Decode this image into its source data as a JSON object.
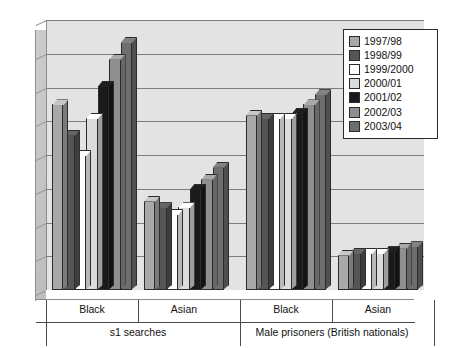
{
  "chart_data": {
    "type": "bar",
    "title": "",
    "subtitle": "",
    "xlabel": "",
    "ylabel": "",
    "ylim": [
      0.0,
      16.0
    ],
    "ytick_step": 2.0,
    "ytick_labels": [
      "0.0",
      "2.0",
      "4.0",
      "6.0",
      "8.0",
      "10.0",
      "12.0",
      "14.0",
      "16.0"
    ],
    "grid": true,
    "legend_position": "top-right",
    "style": "3d-grouped-column",
    "categories": [
      "Black",
      "Asian",
      "Black",
      "Asian"
    ],
    "supergroups": [
      {
        "label": "s1 searches",
        "categories": [
          "Black",
          "Asian"
        ]
      },
      {
        "label": "Male prisoners (British nationals)",
        "categories": [
          "Black",
          "Asian"
        ]
      }
    ],
    "series": [
      {
        "name": "1997/98",
        "color": "#a9a9a9",
        "values": [
          11.0,
          5.3,
          10.4,
          2.1
        ]
      },
      {
        "name": "1998/99",
        "color": "#555555",
        "values": [
          9.2,
          4.9,
          10.2,
          2.2
        ]
      },
      {
        "name": "1999/2000",
        "color": "#ffffff",
        "values": [
          8.0,
          4.5,
          10.2,
          2.2
        ]
      },
      {
        "name": "2000/01",
        "color": "#dcdcdc",
        "values": [
          10.2,
          4.9,
          10.2,
          2.2
        ]
      },
      {
        "name": "2001/02",
        "color": "#1a1a1a",
        "values": [
          12.1,
          6.0,
          10.5,
          2.3
        ]
      },
      {
        "name": "2002/03",
        "color": "#8f8f8f",
        "values": [
          13.7,
          6.6,
          11.0,
          2.5
        ]
      },
      {
        "name": "2003/04",
        "color": "#6e6e6e",
        "values": [
          14.7,
          7.3,
          11.6,
          2.6
        ]
      }
    ]
  },
  "legend": {
    "items": [
      {
        "label": "1997/98",
        "color": "#a9a9a9"
      },
      {
        "label": "1998/99",
        "color": "#555555"
      },
      {
        "label": "1999/2000",
        "color": "#ffffff"
      },
      {
        "label": "2000/01",
        "color": "#dcdcdc"
      },
      {
        "label": "2001/02",
        "color": "#1a1a1a"
      },
      {
        "label": "2002/03",
        "color": "#8f8f8f"
      },
      {
        "label": "2003/04",
        "color": "#6e6e6e"
      }
    ]
  },
  "axes": {
    "y_ticks": [
      "16.0",
      "14.0",
      "12.0",
      "10.0",
      "8.0",
      "6.0",
      "4.0",
      "2.0",
      "0.0"
    ],
    "category_labels": [
      "Black",
      "Asian",
      "Black",
      "Asian"
    ],
    "super_labels": [
      "s1 searches",
      "Male prisoners (British nationals)"
    ]
  },
  "colors": {
    "plot_background": "#e3e3e3",
    "gridline": "#7d7d7d",
    "wall": "#c6c6c6",
    "floor": "#d2d2d2",
    "axis": "#4a4a4a",
    "text": "#111111"
  }
}
